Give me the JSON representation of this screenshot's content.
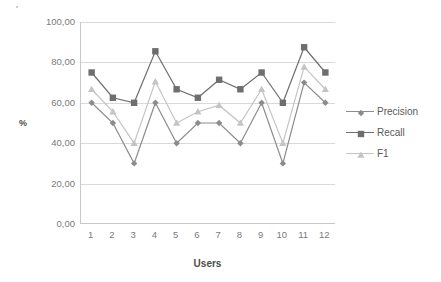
{
  "chart_data": {
    "type": "line",
    "title": "",
    "xlabel": "Users",
    "ylabel": "%",
    "categories": [
      "1",
      "2",
      "3",
      "4",
      "5",
      "6",
      "7",
      "8",
      "9",
      "10",
      "11",
      "12"
    ],
    "ylim": [
      0,
      100
    ],
    "yticks": [
      0,
      20,
      40,
      60,
      80,
      100
    ],
    "ytick_labels": [
      "0,00",
      "20,00",
      "40,00",
      "60,00",
      "80,00",
      "100,00"
    ],
    "grid": true,
    "legend_position": "right",
    "series": [
      {
        "name": "Precision",
        "marker": "diamond",
        "color": "#8c8c8c",
        "values": [
          60.0,
          50.0,
          30.0,
          60.0,
          40.0,
          50.0,
          50.0,
          40.0,
          60.0,
          30.0,
          70.0,
          60.0
        ]
      },
      {
        "name": "Recall",
        "marker": "square",
        "color": "#6e6e6e",
        "values": [
          75.0,
          62.5,
          60.0,
          85.5,
          66.7,
          62.5,
          71.4,
          66.7,
          75.0,
          60.0,
          87.5,
          75.0
        ]
      },
      {
        "name": "F1",
        "marker": "triangle",
        "color": "#c4c4c4",
        "values": [
          66.7,
          55.6,
          40.0,
          70.5,
          50.0,
          55.6,
          58.8,
          50.0,
          66.7,
          40.0,
          77.8,
          66.7
        ]
      }
    ]
  },
  "axes": {
    "y_title": "%",
    "x_title": "Users"
  },
  "legend": {
    "items": [
      {
        "label": "Precision"
      },
      {
        "label": "Recall"
      },
      {
        "label": "F1"
      }
    ]
  },
  "colors": {
    "precision": "#8c8c8c",
    "recall": "#6e6e6e",
    "f1": "#c4c4c4",
    "gridline": "#d9d9d9",
    "axis": "#c8c8c8",
    "tick_text": "#7a7a7a",
    "title_text": "#4d4d4d",
    "background": "#ffffff"
  }
}
